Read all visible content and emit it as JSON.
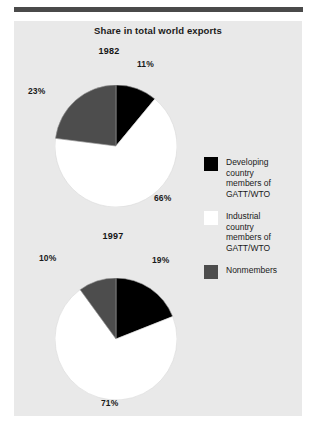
{
  "figure": {
    "title": "Share in total world exports",
    "accent_rule_color": "#4a4a4a",
    "panel_color": "#e9e9e9"
  },
  "legend": {
    "position": "right",
    "items": [
      {
        "label": "Developing\ncountry\nmembers of\nGATT/WTO",
        "color": "#000000",
        "swatch_name": "developing-swatch"
      },
      {
        "label": "Industrial\ncountry\nmembers of\nGATT/WTO",
        "color": "#ffffff",
        "swatch_name": "industrial-swatch"
      },
      {
        "label": "Nonmembers",
        "color": "#4d4d4d",
        "swatch_name": "nonmembers-swatch"
      }
    ]
  },
  "pies": {
    "p1982": {
      "year": "1982",
      "black_label": "11%",
      "white_label": "66%",
      "gray_label": "23%"
    },
    "p1997": {
      "year": "1997",
      "black_label": "19%",
      "white_label": "71%",
      "gray_label": "10%"
    }
  },
  "chart_data": {
    "type": "pie",
    "title": "Share in total world exports",
    "subtitle": "",
    "xlabel": "",
    "ylabel": "",
    "units": "percent of total world exports",
    "legend_position": "right",
    "grid": false,
    "start_angle_deg": 90,
    "direction": "clockwise",
    "categories": [
      "Developing country members of GATT/WTO",
      "Industrial country members of GATT/WTO",
      "Nonmembers"
    ],
    "colors": [
      "#000000",
      "#ffffff",
      "#4d4d4d"
    ],
    "charts": [
      {
        "name": "1982",
        "values": [
          11,
          66,
          23
        ],
        "labels": [
          "11%",
          "66%",
          "23%"
        ]
      },
      {
        "name": "1997",
        "values": [
          19,
          71,
          10
        ],
        "labels": [
          "19%",
          "71%",
          "10%"
        ]
      }
    ]
  }
}
